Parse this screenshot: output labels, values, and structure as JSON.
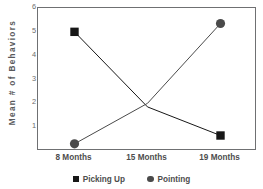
{
  "chart_data": {
    "type": "line",
    "title": "",
    "xlabel": "",
    "ylabel": "Mean # of Behaviors",
    "categories": [
      "8 Months",
      "15 Months",
      "19 Months"
    ],
    "ylim": [
      0,
      6
    ],
    "yticks": [
      6,
      5,
      4,
      3,
      2,
      1
    ],
    "grid": false,
    "legend_position": "bottom",
    "series": [
      {
        "name": "Picking Up",
        "marker": "square",
        "color": "#171717",
        "values": [
          5.0,
          1.85,
          0.65
        ]
      },
      {
        "name": "Pointing",
        "marker": "circle",
        "color": "#4a4a4a",
        "values": [
          0.3,
          2.0,
          5.35
        ]
      }
    ]
  },
  "axis": {
    "ylabel": "Mean # of Behaviors",
    "ytick_labels": [
      "6",
      "5",
      "4",
      "3",
      "2",
      "1"
    ],
    "xtick_labels": [
      "8 Months",
      "15 Months",
      "19 Months"
    ]
  },
  "legend": {
    "items": [
      {
        "label": "Picking Up",
        "marker": "square-marker-icon"
      },
      {
        "label": "Pointing",
        "marker": "circle-marker-icon"
      }
    ]
  }
}
